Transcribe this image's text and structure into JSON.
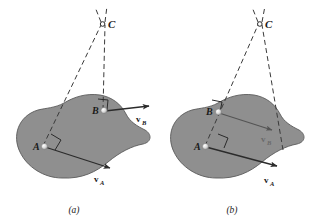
{
  "figure": {
    "background_color": "#ffffff",
    "body_fill": "#8f8f8f",
    "body_stroke": "#4a4a4a",
    "line_color": "#333333",
    "dash_color": "#3a3a3a",
    "label_color": "#1a1a1a",
    "faint_label_color": "#6a6a6a"
  },
  "panels": [
    {
      "id": "a",
      "caption": "(a)",
      "center_label": "C",
      "points": [
        {
          "name": "A",
          "label": "A"
        },
        {
          "name": "B",
          "label": "B"
        }
      ],
      "vectors": [
        {
          "name": "vA",
          "symbol": "v",
          "subscript": "A"
        },
        {
          "name": "vB",
          "symbol": "v",
          "subscript": "B"
        }
      ],
      "right_angle_markers": 2,
      "construction_lines": 2
    },
    {
      "id": "b",
      "caption": "(b)",
      "center_label": "C",
      "points": [
        {
          "name": "A",
          "label": "A"
        },
        {
          "name": "B",
          "label": "B"
        }
      ],
      "vectors": [
        {
          "name": "vA",
          "symbol": "v",
          "subscript": "A"
        },
        {
          "name": "vB",
          "symbol": "v",
          "subscript": "B"
        }
      ],
      "right_angle_markers": 2,
      "construction_lines": 2
    }
  ]
}
